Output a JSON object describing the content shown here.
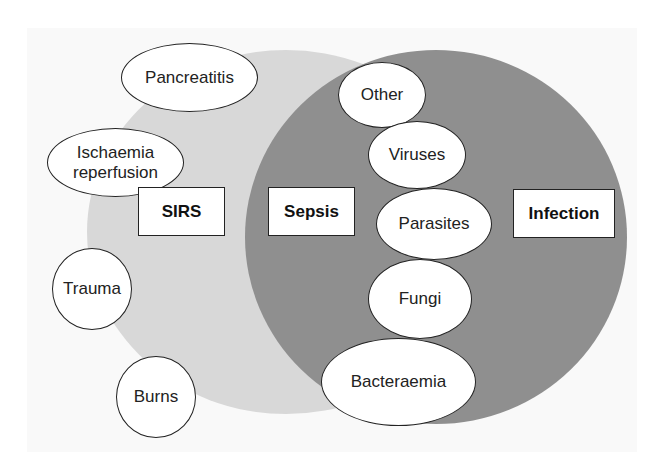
{
  "diagram": {
    "type": "venn",
    "colors": {
      "background": "#ffffff",
      "panel": "#f9f9f9",
      "sirs_region": "#d8d8d8",
      "infection_region": "#8f8f8f",
      "node_fill": "#ffffff",
      "node_border": "#222222"
    },
    "sets": {
      "sirs": {
        "label": "SIRS"
      },
      "sepsis": {
        "label": "Sepsis"
      },
      "infection": {
        "label": "Infection"
      }
    },
    "sirs_causes": [
      {
        "label": "Pancreatitis"
      },
      {
        "label": "Ischaemia\nreperfusion"
      },
      {
        "label": "Trauma"
      },
      {
        "label": "Burns"
      }
    ],
    "infection_types": [
      {
        "label": "Other"
      },
      {
        "label": "Viruses"
      },
      {
        "label": "Parasites"
      },
      {
        "label": "Fungi"
      },
      {
        "label": "Bacteraemia"
      }
    ]
  }
}
